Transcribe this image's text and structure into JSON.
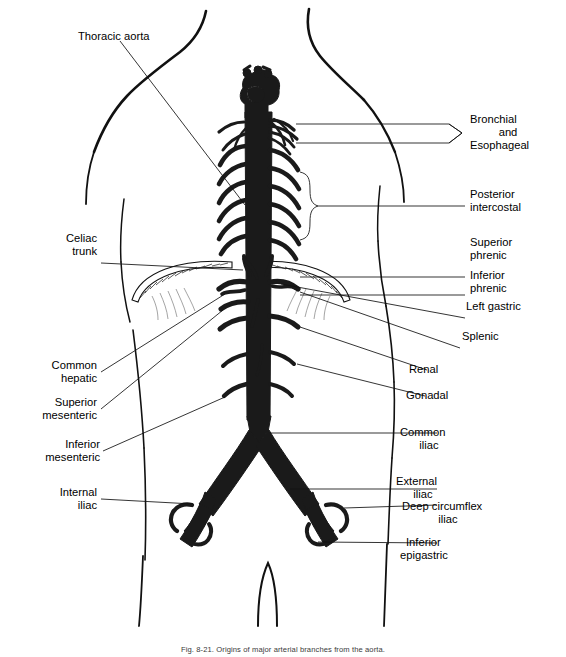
{
  "figure": {
    "caption": "Fig. 8-21. Origins of major arterial branches from the aorta.",
    "background_color": "#ffffff",
    "ink_color": "#000000",
    "vessel_fill": "#1a1a1a"
  },
  "labels": {
    "thoracic_aorta": "Thoracic aorta",
    "celiac_trunk_l1": "Celiac",
    "celiac_trunk_l2": "trunk",
    "common_hepatic_l1": "Common",
    "common_hepatic_l2": "hepatic",
    "superior_mesenteric_l1": "Superior",
    "superior_mesenteric_l2": "mesenteric",
    "inferior_mesenteric_l1": "Inferior",
    "inferior_mesenteric_l2": "mesenteric",
    "internal_iliac_l1": "Internal",
    "internal_iliac_l2": "iliac",
    "bronchial_esophageal_l1": "Bronchial",
    "bronchial_esophageal_l2": "and",
    "bronchial_esophageal_l3": "Esophageal",
    "posterior_intercostal_l1": "Posterior",
    "posterior_intercostal_l2": "intercostal",
    "superior_phrenic_l1": "Superior",
    "superior_phrenic_l2": "phrenic",
    "inferior_phrenic_l1": "Inferior",
    "inferior_phrenic_l2": "phrenic",
    "left_gastric": "Left gastric",
    "splenic": "Splenic",
    "renal": "Renal",
    "gonadal": "Gonadal",
    "common_iliac_l1": "Common",
    "common_iliac_l2": "iliac",
    "external_iliac_l1": "External",
    "external_iliac_l2": "iliac",
    "deep_circumflex_iliac_l1": "Deep circumflex",
    "deep_circumflex_iliac_l2": "iliac",
    "inferior_epigastric_l1": "Inferior",
    "inferior_epigastric_l2": "epigastric"
  },
  "anatomy": {
    "structures": [
      "torso outline",
      "aortic arch",
      "thoracic aorta",
      "posterior intercostal arteries",
      "diaphragm",
      "celiac trunk",
      "superior mesenteric artery",
      "renal arteries",
      "gonadal arteries",
      "inferior mesenteric artery",
      "common iliac arteries",
      "internal iliac arteries",
      "external iliac arteries",
      "deep circumflex iliac arteries",
      "inferior epigastric arteries"
    ]
  }
}
